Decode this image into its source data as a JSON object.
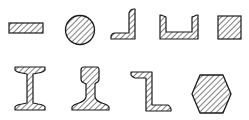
{
  "diagram": {
    "style": {
      "stroke": "#1a1a1a",
      "hatch": "#3a3a3a",
      "background": "#ffffff"
    },
    "rows": [
      {
        "shapes": [
          {
            "id": "flat-bar",
            "name": "Flat bar"
          },
          {
            "id": "round-bar",
            "name": "Round bar"
          },
          {
            "id": "angle",
            "name": "Angle (L-section)"
          },
          {
            "id": "channel",
            "name": "Channel (U-section)"
          },
          {
            "id": "square-bar",
            "name": "Square bar"
          }
        ]
      },
      {
        "shapes": [
          {
            "id": "i-beam",
            "name": "I-beam"
          },
          {
            "id": "rail",
            "name": "Rail"
          },
          {
            "id": "z-section",
            "name": "Z-section"
          },
          {
            "id": "hexagon-bar",
            "name": "Hexagonal bar"
          }
        ]
      }
    ]
  }
}
